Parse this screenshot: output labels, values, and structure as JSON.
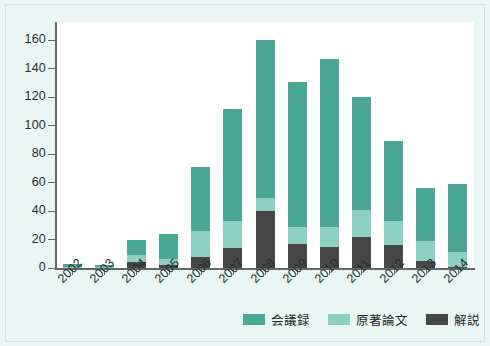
{
  "chart_data": {
    "type": "bar",
    "subtype": "stacked-vertical",
    "title": "",
    "xlabel": "",
    "ylabel": "",
    "ylim": [
      0,
      170
    ],
    "yticks": [
      0,
      20,
      40,
      60,
      80,
      100,
      120,
      140,
      160
    ],
    "grid": false,
    "legend_position": "bottom-right",
    "categories": [
      "2002",
      "2003",
      "2004",
      "2005",
      "2006",
      "2007",
      "2008",
      "2009",
      "2010",
      "2011",
      "2012",
      "2013",
      "2014"
    ],
    "series": [
      {
        "name": "解説",
        "color": "#474747",
        "values": [
          0,
          0,
          4,
          2,
          8,
          14,
          40,
          17,
          15,
          22,
          16,
          5,
          1
        ]
      },
      {
        "name": "原著論文",
        "color": "#8bd0c2",
        "values": [
          1,
          1,
          5,
          4,
          18,
          19,
          9,
          12,
          14,
          19,
          17,
          14,
          10
        ]
      },
      {
        "name": "会議録",
        "color": "#4aa796",
        "values": [
          2,
          1,
          11,
          18,
          45,
          79,
          111,
          102,
          118,
          79,
          56,
          37,
          48
        ]
      }
    ],
    "totals": [
      3,
      2,
      20,
      24,
      71,
      112,
      160,
      131,
      147,
      120,
      89,
      56,
      59
    ],
    "stack_order_bottom_to_top": [
      "解説",
      "原著論文",
      "会議録"
    ]
  },
  "legend": {
    "items": [
      {
        "label": "会議録",
        "color": "#4aa796"
      },
      {
        "label": "原著論文",
        "color": "#8bd0c2"
      },
      {
        "label": "解説",
        "color": "#474747"
      }
    ]
  },
  "axes": {
    "y_tick_labels": [
      "160",
      "140",
      "120",
      "100",
      "80",
      "60",
      "40",
      "20",
      "0"
    ],
    "x_tick_labels": [
      "2002",
      "2003",
      "2004",
      "2005",
      "2006",
      "2007",
      "2008",
      "2009",
      "2010",
      "2011",
      "2012",
      "2013",
      "2014"
    ]
  },
  "colors": {
    "background": "#e9f6f3",
    "plot_background": "#ffffff",
    "axis": "#5f6b68",
    "kaigiroku": "#4aa796",
    "genchaku": "#8bd0c2",
    "kaisetsu": "#474747"
  }
}
